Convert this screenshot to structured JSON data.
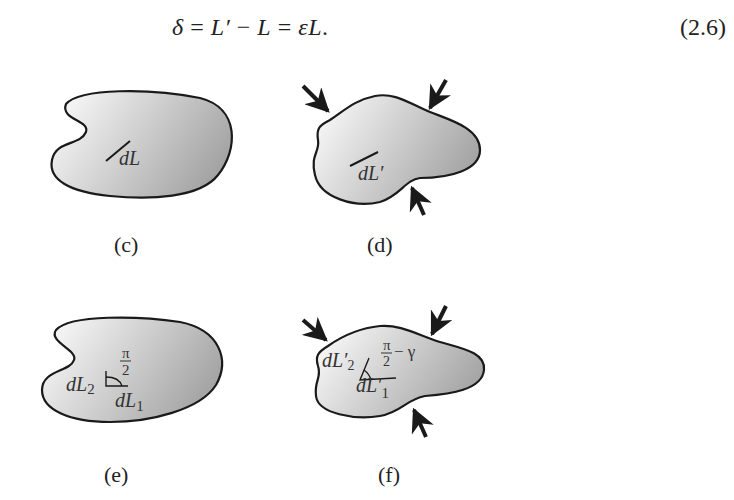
{
  "equation": {
    "text": "δ = L′ − L = εL.",
    "parts": [
      "δ",
      " = ",
      "L′",
      " − ",
      "L",
      " = ",
      "εL",
      "."
    ],
    "number": "(2.6)"
  },
  "figures": [
    {
      "id": "c",
      "caption": "(c)",
      "labels": {
        "element": "dL"
      },
      "loaded": false
    },
    {
      "id": "d",
      "caption": "(d)",
      "labels": {
        "element": "dL′"
      },
      "loaded": true,
      "arrow_count": 3
    },
    {
      "id": "e",
      "caption": "(e)",
      "labels": {
        "element_2": "dL",
        "sub_2": "2",
        "element_1": "dL",
        "sub_1": "1",
        "angle_num": "π",
        "angle_den": "2"
      },
      "loaded": false
    },
    {
      "id": "f",
      "caption": "(f)",
      "labels": {
        "element_2": "dL′",
        "sub_2": "2",
        "element_1": "dL′",
        "sub_1": "1",
        "angle_num": "π",
        "angle_den": "2",
        "angle_suffix": "− γ"
      },
      "loaded": true,
      "arrow_count": 3
    }
  ],
  "colors": {
    "shape_fill_light": "#f4f4f4",
    "shape_fill_dark": "#a9a9a9",
    "stroke": "#1a1a1a"
  }
}
